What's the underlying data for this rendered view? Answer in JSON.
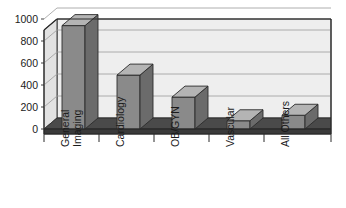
{
  "chart_data": {
    "type": "bar",
    "title": "",
    "subtitle": "",
    "xlabel": "",
    "ylabel": "",
    "categories": [
      "General Imaging",
      "Cardiology",
      "OB/GYN",
      "Vascular",
      "All Others"
    ],
    "category_lines": [
      [
        "General",
        "Imaging"
      ],
      [
        "Cardiology"
      ],
      [
        "OB/GYN"
      ],
      [
        "Vascular"
      ],
      [
        "All Others"
      ]
    ],
    "values": [
      940,
      490,
      290,
      75,
      125
    ],
    "ylim": [
      0,
      1000
    ],
    "ytick_values": [
      0,
      200,
      400,
      600,
      800,
      1000
    ],
    "ytick_labels": [
      "0",
      "200",
      "400",
      "600",
      "800",
      "1000"
    ],
    "grid": true,
    "grid_axis": "y",
    "legend": false,
    "legend_position": "none",
    "three_d": true,
    "annotations": []
  },
  "style": {
    "bar_front_color": "#8a8a8a",
    "bar_side_color": "#6b6b6b",
    "bar_top_color": "#b4b4b4",
    "wall_back_color": "#eeeeee",
    "wall_left_color": "#e2e2e2",
    "floor_color": "#4a4a4a",
    "floor_side_color": "#3a3a3a",
    "grid_color": "#9a9a9a",
    "frame_color": "#2b2b2b",
    "text_color": "#1b1b1b",
    "background": "#ffffff"
  },
  "geometry": {
    "plot_left": 44,
    "plot_right": 331,
    "plot_top": 19,
    "plot_base": 129,
    "depth_x": 13,
    "depth_y": 11,
    "bar_width": 23,
    "bar_slots_x": [
      62,
      117,
      172,
      227,
      282
    ]
  }
}
